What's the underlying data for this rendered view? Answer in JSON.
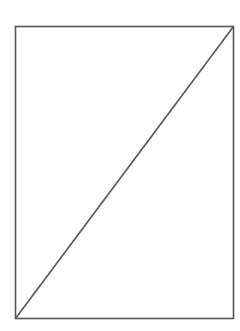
{
  "diagram": {
    "canvas": {
      "width": 240,
      "height": 331,
      "background": "#ffffff"
    },
    "stroke_color": "#555555",
    "stroke_width": 1.6,
    "rectangle": {
      "x": 15.5,
      "y": 26.5,
      "width": 218,
      "height": 292
    },
    "diagonal": {
      "x1": 15.5,
      "y1": 318.5,
      "x2": 233.5,
      "y2": 26.5
    }
  }
}
